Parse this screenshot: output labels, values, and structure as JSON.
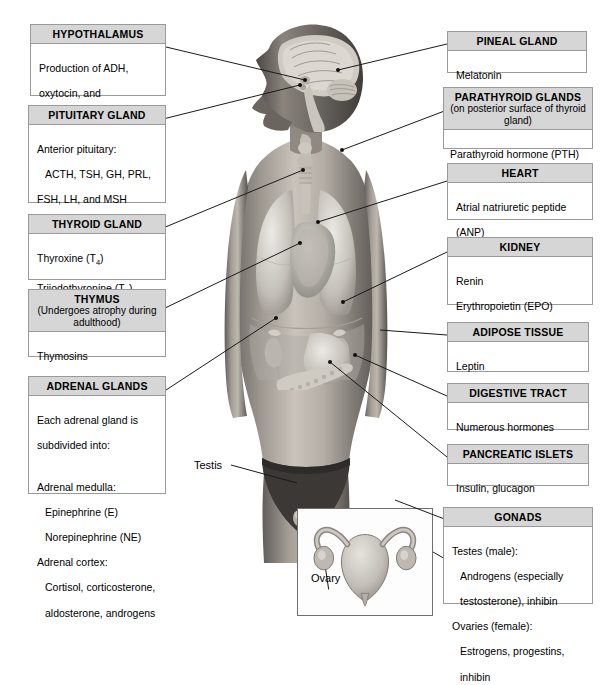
{
  "figure": {
    "body_label": "human-body-anatomical-illustration",
    "testis_label": "Testis",
    "ovary_label": "Ovary"
  },
  "boxes": {
    "hypothalamus": {
      "title": "HYPOTHALAMUS",
      "subtitle": "",
      "lines": [
        "Production of ADH,",
        "oxytocin, and",
        "regulatory hormones"
      ]
    },
    "pituitary": {
      "title": "PITUITARY GLAND",
      "subtitle": "",
      "lines": [
        "Anterior pituitary:",
        "ACTH, TSH, GH, PRL,",
        "FSH, LH, and MSH",
        "Posterior pituitary:",
        "Release of oxytocin",
        "and ADH"
      ]
    },
    "thyroid": {
      "title": "THYROID GLAND",
      "subtitle": "",
      "lines": [
        "Thyroxine (T4)",
        "Triiodothyronine (T3)",
        "Calcitonin (CT)"
      ]
    },
    "thymus": {
      "title": "THYMUS",
      "subtitle": "(Undergoes atrophy during adulthood)",
      "lines": [
        "Thymosins"
      ]
    },
    "adrenal": {
      "title": "ADRENAL GLANDS",
      "subtitle": "",
      "lines": [
        "Each adrenal gland is",
        "subdivided into:",
        "Adrenal medulla:",
        "Epinephrine (E)",
        "Norepinephrine (NE)",
        "Adrenal cortex:",
        "Cortisol, corticosterone,",
        "aldosterone, androgens"
      ]
    },
    "pineal": {
      "title": "PINEAL GLAND",
      "subtitle": "",
      "lines": [
        "Melatonin"
      ]
    },
    "parathyroid": {
      "title": "PARATHYROID  GLANDS",
      "subtitle": "(on posterior surface of thyroid gland)",
      "lines": [
        "Parathyroid hormone (PTH)"
      ]
    },
    "heart": {
      "title": "HEART",
      "subtitle": "",
      "lines": [
        "Atrial natriuretic peptide",
        "(ANP)"
      ],
      "italic": "(Chapter 12)"
    },
    "kidney": {
      "title": "KIDNEY",
      "subtitle": "",
      "lines": [
        "Renin",
        "Erythropoietin (EPO)",
        "Calcitriol"
      ],
      "italic": "(Chapters 11 and 18)"
    },
    "adipose": {
      "title": "ADIPOSE TISSUE",
      "subtitle": "",
      "lines": [
        "Leptin",
        "Resistin"
      ]
    },
    "digestive": {
      "title": "DIGESTIVE TRACT",
      "subtitle": "",
      "lines": [
        "Numerous hormones"
      ],
      "italic": "(detailed in Chapter 16)"
    },
    "pancreatic": {
      "title": "PANCREATIC ISLETS",
      "subtitle": "",
      "lines": [
        "Insulin, glucagon"
      ]
    },
    "gonads": {
      "title": "GONADS",
      "subtitle": "",
      "lines": [
        "Testes (male):",
        "Androgens (especially",
        "testosterone), inhibin",
        "Ovaries (female):",
        "Estrogens, progestins,",
        "inhibin"
      ]
    }
  },
  "colors": {
    "header_fill": "#d6d6d6",
    "border": "#9a9a9a",
    "line": "#1a1a1a",
    "text": "#000000"
  }
}
